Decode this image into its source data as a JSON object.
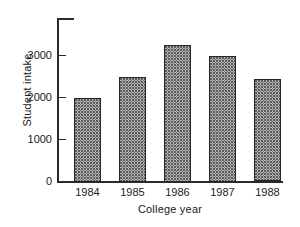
{
  "chart_data": {
    "type": "bar",
    "title": "",
    "xlabel": "College year",
    "ylabel": "Student intake",
    "categories": [
      "1984",
      "1985",
      "1986",
      "1987",
      "1988"
    ],
    "values": [
      2000,
      2500,
      3250,
      3000,
      2450
    ],
    "yticks": [
      0,
      1000,
      2000,
      3000
    ],
    "ytick_labels": [
      "0",
      "1000",
      "2000",
      "3000"
    ],
    "ylim": [
      0,
      3900
    ],
    "grid": false,
    "legend": false,
    "legend_position": "none",
    "bar_fill": "dotted-stipple",
    "bar_edge_color": "#262626",
    "axis_color": "#2b2b2b",
    "background_color": "#ffffff"
  }
}
